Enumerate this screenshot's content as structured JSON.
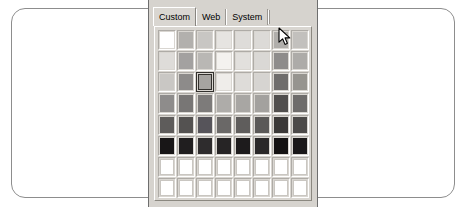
{
  "window": {
    "background_color": "#ffffff",
    "card_border_color": "#8d8d8d"
  },
  "color_picker": {
    "panel_background": "#d6d3ce",
    "tabs": [
      {
        "label": "Custom",
        "active": true
      },
      {
        "label": "Web",
        "active": false
      },
      {
        "label": "System",
        "active": false
      }
    ],
    "grid": {
      "columns": 8,
      "rows": 8,
      "selected_cell": {
        "row": 3,
        "column": 3
      },
      "swatches": [
        [
          "#ffffff",
          "#b2b0ad",
          "#c8c6c3",
          "#e6e4e1",
          "#dedcd9",
          "#dcdad7",
          "#b0aeab",
          "#c2c0bd"
        ],
        [
          "#dedcd9",
          "#a3a1a0",
          "#b9b7b4",
          "#f4f2ef",
          "#e2e0dd",
          "#dad8d5",
          "#8e8c8b",
          "#adaba8"
        ],
        [
          "#c9c7c4",
          "#8d8b8a",
          "#a6a4a1",
          "#efedea",
          "#dedcd9",
          "#d6d4d1",
          "#6f6d6c",
          "#96948f"
        ],
        [
          "#8e8c8b",
          "#787675",
          "#7d7b7a",
          "#aeaca9",
          "#a8a6a3",
          "#a3a19e",
          "#514f4e",
          "#6e6c6b"
        ],
        [
          "#5e5c5b",
          "#545251",
          "#56545a",
          "#6a6867",
          "#5f5d5c",
          "#5b5958",
          "#3b3938",
          "#4c4a49"
        ],
        [
          "#181617",
          "#201e1f",
          "#2e2c2d",
          "#262425",
          "#1d1b1c",
          "#2a2829",
          "#131112",
          "#1a1819"
        ],
        [
          "",
          "",
          "",
          "",
          "",
          "",
          "",
          ""
        ],
        [
          "",
          "",
          "",
          "",
          "",
          "",
          "",
          ""
        ]
      ]
    }
  },
  "cursor": {
    "type": "arrow-pointer",
    "x": 277,
    "y": 27
  }
}
